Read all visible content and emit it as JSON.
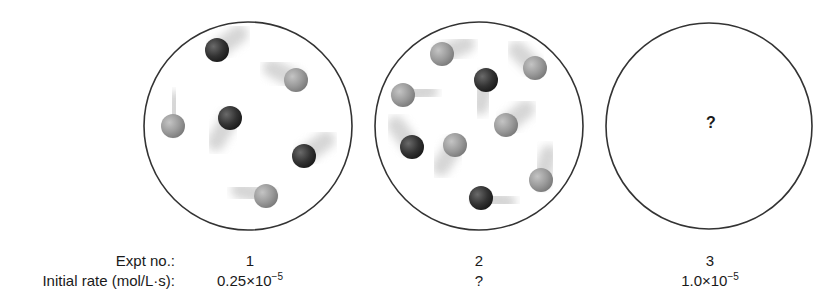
{
  "rows": {
    "expt_label": "Expt no.:",
    "rate_label": "Initial rate (mol/L·s):"
  },
  "experiments": [
    {
      "number": "1",
      "rate_mantissa": "0.25×10",
      "rate_exponent": "−5",
      "dark_count": 3,
      "light_count": 3
    },
    {
      "number": "2",
      "rate": "?",
      "dark_count": 3,
      "light_count": 6
    },
    {
      "number": "3",
      "rate_mantissa": "1.0×10",
      "rate_exponent": "−5",
      "unknown_mark": "?"
    }
  ],
  "containers": [
    {
      "cx": 248,
      "cy": 126,
      "r": 104,
      "particles": [
        {
          "type": "dark",
          "x": 217,
          "y": 50,
          "tdx": 22,
          "tdy": -16
        },
        {
          "type": "light",
          "x": 296,
          "y": 80,
          "tdx": -24,
          "tdy": -12
        },
        {
          "type": "dark",
          "x": 230,
          "y": 118,
          "tdx": -14,
          "tdy": 24
        },
        {
          "type": "light",
          "x": 173,
          "y": 126,
          "tdx": 2,
          "tdy": -26
        },
        {
          "type": "dark",
          "x": 304,
          "y": 156,
          "tdx": 22,
          "tdy": -16
        },
        {
          "type": "light",
          "x": 266,
          "y": 196,
          "tdx": -26,
          "tdy": -6
        }
      ]
    },
    {
      "cx": 479,
      "cy": 126,
      "r": 104,
      "particles": [
        {
          "type": "light",
          "x": 442,
          "y": 54,
          "tdx": 24,
          "tdy": -10
        },
        {
          "type": "light",
          "x": 535,
          "y": 68,
          "tdx": -18,
          "tdy": -18
        },
        {
          "type": "dark",
          "x": 486,
          "y": 80,
          "tdx": -6,
          "tdy": 26
        },
        {
          "type": "light",
          "x": 403,
          "y": 95,
          "tdx": 26,
          "tdy": -4
        },
        {
          "type": "light",
          "x": 506,
          "y": 125,
          "tdx": 20,
          "tdy": -16
        },
        {
          "type": "dark",
          "x": 412,
          "y": 147,
          "tdx": -16,
          "tdy": -22
        },
        {
          "type": "light",
          "x": 455,
          "y": 145,
          "tdx": -14,
          "tdy": 22
        },
        {
          "type": "light",
          "x": 541,
          "y": 180,
          "tdx": 8,
          "tdy": -26
        },
        {
          "type": "dark",
          "x": 481,
          "y": 198,
          "tdx": 26,
          "tdy": 4
        }
      ]
    },
    {
      "cx": 709,
      "cy": 126,
      "r": 103,
      "particles": []
    }
  ],
  "colors": {
    "outline": "#333333",
    "dark_particle": "#3a3a3a",
    "light_particle": "#9a9a9a",
    "trail": "#c8c8c8"
  }
}
